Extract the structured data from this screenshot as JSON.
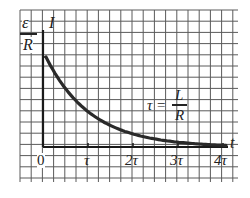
{
  "chart_data": {
    "type": "line",
    "title": "",
    "xlabel": "t",
    "ylabel": "I",
    "y_max_label": {
      "numerator": "ε",
      "denominator": "R"
    },
    "annotation": {
      "lhs": "τ =",
      "numerator": "L",
      "denominator": "R"
    },
    "x_tick_labels": [
      "0",
      "τ",
      "2τ",
      "3τ",
      "4τ"
    ],
    "x_ticks": [
      0,
      1,
      2,
      3,
      4
    ],
    "xlim": [
      0,
      4
    ],
    "ylim": [
      0,
      1
    ],
    "grid": true,
    "series": [
      {
        "name": "I(t) = (ε/R) e^(-t/τ)",
        "x": [
          0,
          0.5,
          1,
          1.5,
          2,
          2.5,
          3,
          3.5,
          4
        ],
        "values": [
          1.0,
          0.61,
          0.37,
          0.22,
          0.14,
          0.08,
          0.05,
          0.03,
          0.02
        ]
      }
    ],
    "colors": {
      "curve": "#2a2a2a",
      "grid": "#555555",
      "axes": "#1a1a1a"
    }
  }
}
